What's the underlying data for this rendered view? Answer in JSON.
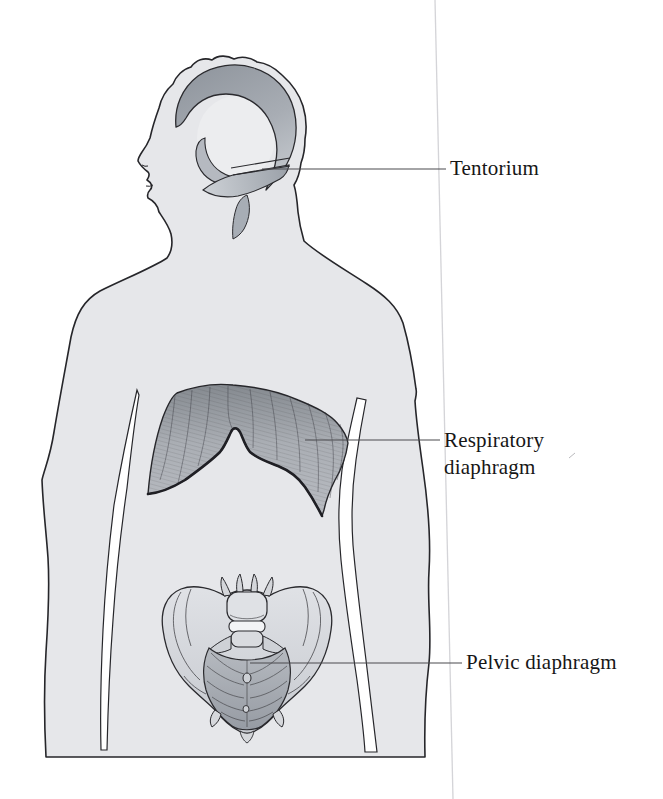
{
  "figure": {
    "labels": [
      {
        "id": "tentorium",
        "text": "Tentorium"
      },
      {
        "id": "respiratory-diaphragm",
        "text": "Respiratory\ndiaphragm"
      },
      {
        "id": "pelvic-diaphragm",
        "text": "Pelvic diaphragm"
      }
    ],
    "colors": {
      "background": "#ffffff",
      "body_fill": "#e6e7ea",
      "outline": "#26262a",
      "falx_dark": "#8f959d",
      "falx_light": "#c8ccd1",
      "tentorium_fill": "#aab0b7",
      "diaphragm_dark": "#82878e",
      "diaphragm_light": "#b9bcc2",
      "bone_fill": "#dcdee2",
      "muscle_fill": "#a9aeb5",
      "leader_line": "#4a4a4e",
      "label_text": "#161616"
    }
  }
}
